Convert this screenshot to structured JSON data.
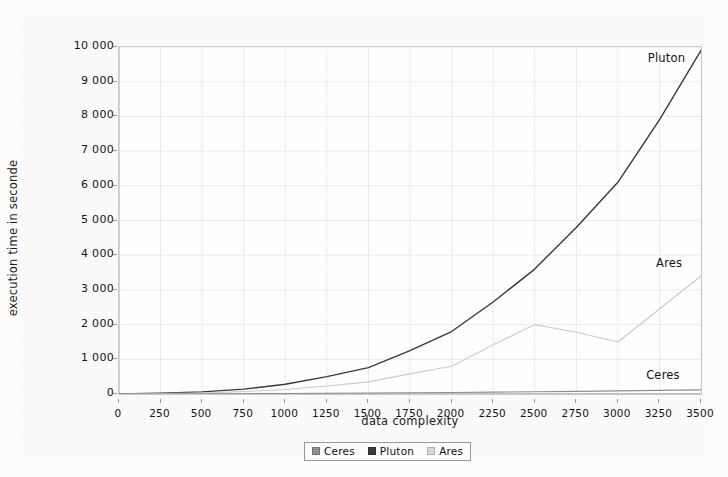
{
  "chart_data": {
    "type": "line",
    "title": "",
    "xlabel": "data complexity",
    "ylabel": "execution time in seconde",
    "xlim": [
      0,
      3500
    ],
    "ylim": [
      0,
      10000
    ],
    "xticks": [
      0,
      250,
      500,
      750,
      1000,
      1250,
      1500,
      1750,
      2000,
      2250,
      2500,
      2750,
      3000,
      3250,
      3500
    ],
    "xtick_labels": [
      "0",
      "250",
      "500",
      "750",
      "1000",
      "1250",
      "1500",
      "1750",
      "2000",
      "2250",
      "2500",
      "2750",
      "3000",
      "3250",
      "3500"
    ],
    "yticks": [
      0,
      1000,
      2000,
      3000,
      4000,
      5000,
      6000,
      7000,
      8000,
      9000,
      10000
    ],
    "ytick_labels": [
      "0",
      "1 000",
      "2 000",
      "3 000",
      "4 000",
      "5 000",
      "6 000",
      "7 000",
      "8 000",
      "9 000",
      "10 000"
    ],
    "grid": true,
    "legend_position": "bottom",
    "x": [
      0,
      250,
      500,
      750,
      1000,
      1250,
      1500,
      1750,
      2000,
      2250,
      2500,
      2750,
      3000,
      3250,
      3500
    ],
    "series": [
      {
        "name": "Ceres",
        "color": "#8f8f8f",
        "values": [
          0,
          2,
          5,
          9,
          14,
          20,
          27,
          35,
          44,
          54,
          65,
          77,
          90,
          104,
          120
        ]
      },
      {
        "name": "Pluton",
        "color": "#3a3a3a",
        "values": [
          0,
          20,
          60,
          140,
          280,
          500,
          760,
          1250,
          1800,
          2650,
          3600,
          4800,
          6100,
          7900,
          9900
        ]
      },
      {
        "name": "Ares",
        "color": "#cccccc",
        "values": [
          0,
          10,
          30,
          70,
          130,
          230,
          350,
          580,
          800,
          1420,
          2000,
          1780,
          1500,
          2450,
          3400
        ]
      }
    ],
    "annotations": [
      {
        "text": "Pluton",
        "x": 3180,
        "y": 9650
      },
      {
        "text": "Ares",
        "x": 3230,
        "y": 3750
      },
      {
        "text": "Ceres",
        "x": 3170,
        "y": 520
      }
    ]
  },
  "legend": {
    "items": [
      {
        "label": "Ceres",
        "color": "#8f8f8f"
      },
      {
        "label": "Pluton",
        "color": "#3a3a3a"
      },
      {
        "label": "Ares",
        "color": "#d8d8d8"
      }
    ]
  }
}
